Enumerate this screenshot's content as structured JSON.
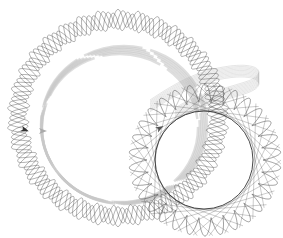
{
  "canvas": {
    "width": 283,
    "height": 238,
    "background": "#ffffff"
  },
  "drawings": [
    {
      "name": "large-spirograph-ring",
      "cx": 118,
      "cy": 118,
      "r": 100,
      "band": 9,
      "loops": 34,
      "color": "#555555",
      "strokes": 4,
      "opacity": 0.75
    },
    {
      "name": "faded-inner-ring",
      "cx": 120,
      "cy": 128,
      "r": 78,
      "band": 6,
      "loops": 0,
      "color": "#c8c8c8",
      "strokes": 6,
      "opacity": 0.6
    },
    {
      "name": "star-spirograph",
      "cx": 205,
      "cy": 160,
      "r": 58,
      "band": 18,
      "loops": 30,
      "color": "#444444",
      "strokes": 1,
      "opacity": 0.85
    },
    {
      "name": "inner-circle",
      "cx": 204,
      "cy": 160,
      "r": 49,
      "band": 0,
      "loops": 0,
      "color": "#333333",
      "strokes": 1,
      "opacity": 0.9
    }
  ],
  "ribbon": {
    "name": "faded-ribbon",
    "color": "#999999",
    "opacity": 0.5
  },
  "turtles": [
    {
      "name": "turtle-marker-dark",
      "x": 25,
      "y": 130,
      "angle": 20,
      "color": "#333333"
    },
    {
      "name": "turtle-marker-light",
      "x": 43,
      "y": 131,
      "angle": 0,
      "color": "#aaaaaa"
    },
    {
      "name": "turtle-marker-mid",
      "x": 160,
      "y": 128,
      "angle": -30,
      "color": "#555555"
    }
  ]
}
